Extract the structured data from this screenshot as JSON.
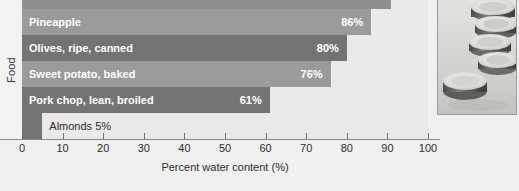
{
  "chart_data": {
    "type": "bar",
    "orientation": "horizontal",
    "title": "",
    "xlabel": "Percent water content (%)",
    "ylabel": "Food",
    "xlim": [
      0,
      100
    ],
    "xticks": [
      0,
      10,
      20,
      30,
      40,
      50,
      60,
      70,
      80,
      90,
      100
    ],
    "xtick_labels": [
      "0",
      "10",
      "20",
      "30",
      "40",
      "50",
      "60",
      "70",
      "80",
      "90",
      "100"
    ],
    "grid": false,
    "legend": null,
    "categories": [
      "Pineapple",
      "Olives, ripe, canned",
      "Sweet potato, baked",
      "Pork chop, lean, broiled",
      "Almonds"
    ],
    "values": [
      86,
      80,
      76,
      61,
      5
    ],
    "value_labels": [
      "86%",
      "80%",
      "76%",
      "61%",
      "5%"
    ],
    "bars": [
      {
        "label": "Pineapple",
        "value": 86,
        "value_label": "86%",
        "color": "#9a9a9a",
        "label_inside": true,
        "value_inside": true
      },
      {
        "label": "Olives, ripe, canned",
        "value": 80,
        "value_label": "80%",
        "color": "#737373",
        "label_inside": true,
        "value_inside": true
      },
      {
        "label": "Sweet potato, baked",
        "value": 76,
        "value_label": "76%",
        "color": "#9a9a9a",
        "label_inside": true,
        "value_inside": true
      },
      {
        "label": "Pork chop, lean, broiled",
        "value": 61,
        "value_label": "61%",
        "color": "#737373",
        "label_inside": true,
        "value_inside": true
      },
      {
        "label": "Almonds",
        "value": 5,
        "value_label": "5%",
        "color": "#737373",
        "label_inside": false,
        "value_inside": false,
        "outside_text": "Almonds 5%"
      }
    ],
    "partial_top_bar": {
      "value": 91,
      "color": "#8f8f8f",
      "note": "cropped at top edge"
    },
    "plot_background": "#e9e9e7",
    "figure_background": "#f0f0ee"
  },
  "axis": {
    "y_title": "Food",
    "x_title": "Percent water content (%)"
  },
  "photo": {
    "alt_name": "sliced-cucumber-photo"
  },
  "caption": {
    "text": ""
  }
}
